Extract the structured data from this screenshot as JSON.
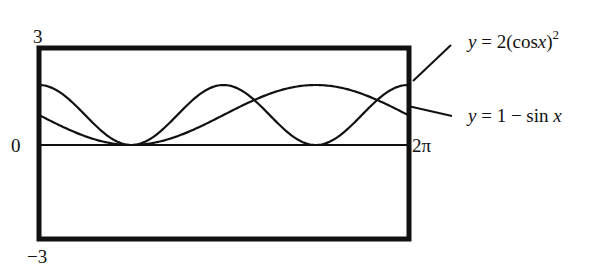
{
  "chart_data": {
    "type": "line",
    "title": "",
    "xlabel": "",
    "ylabel": "",
    "xlim": [
      0,
      6.2832
    ],
    "ylim": [
      -3,
      3
    ],
    "grid": false,
    "x_tick_labels": {
      "zero": "0",
      "end": "2π"
    },
    "y_tick_labels": {
      "top": "3",
      "bottom": "−3"
    },
    "series": [
      {
        "name": "y = 2(cos x)^2",
        "label_prefix": "y",
        "label_eq": " = 2(cos",
        "label_var": "x",
        "label_close": ")",
        "label_sup": "2",
        "function": "2*cos(x)^2"
      },
      {
        "name": "y = 1 − sin x",
        "label_prefix": "y",
        "label_eq": " = 1 − sin ",
        "label_var": "x",
        "function": "1-sin(x)"
      }
    ],
    "legend": "right, with leader lines"
  }
}
